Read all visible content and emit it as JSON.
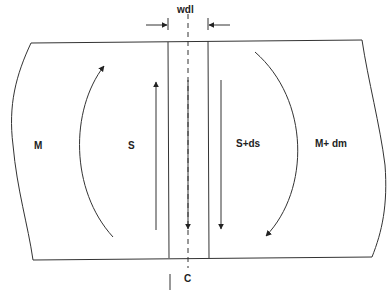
{
  "diagram": {
    "labels": {
      "width": "wdl",
      "left_moment": "M",
      "left_shear": "S",
      "right_shear": "S+ds",
      "right_moment": "M+ dm",
      "centerline": "C"
    },
    "colors": {
      "line": "#333333",
      "text": "#222222",
      "background": "#ffffff"
    }
  }
}
